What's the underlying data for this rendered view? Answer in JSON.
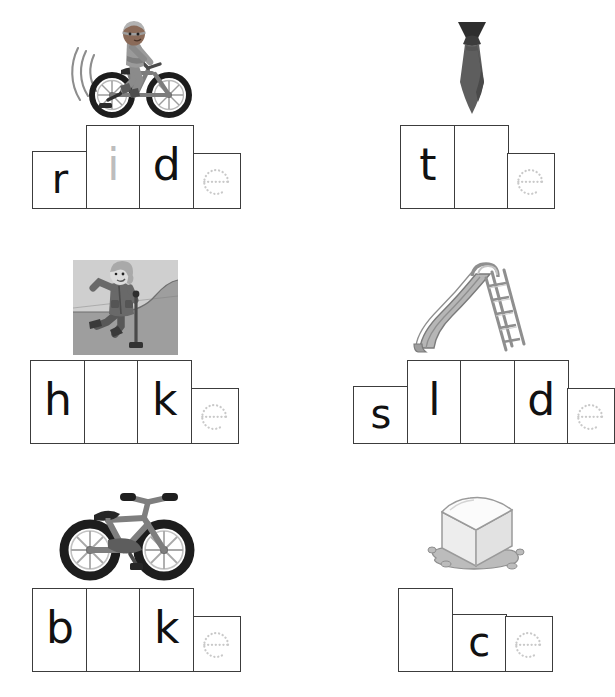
{
  "worksheet": {
    "type": "phonics-worksheet",
    "theme": "long-i magic-e words",
    "background_color": "#ffffff",
    "ink_color": "#3c3c3c",
    "letter_color": "#111111",
    "faint_letter_color": "#bdbdbd",
    "trace_letter_color": "#c9c9c9"
  },
  "items": [
    {
      "id": "item-ride",
      "word": "ride",
      "picture_name": "child-riding-bicycle-picture",
      "picture_alt": "child riding a bicycle with motion lines",
      "cells": [
        {
          "letter": "r",
          "height": "short",
          "style": "bold"
        },
        {
          "letter": "i",
          "height": "tall",
          "style": "faint"
        },
        {
          "letter": "d",
          "height": "tall",
          "style": "bold"
        },
        {
          "letter": "e",
          "height": "trace",
          "style": "dotted"
        }
      ]
    },
    {
      "id": "item-tie",
      "word": "tie",
      "picture_name": "necktie-picture",
      "picture_alt": "dark gray necktie",
      "cells": [
        {
          "letter": "t",
          "height": "tall",
          "style": "bold"
        },
        {
          "letter": "",
          "height": "tall",
          "style": "blank"
        },
        {
          "letter": "e",
          "height": "trace",
          "style": "dotted"
        }
      ]
    },
    {
      "id": "item-hike",
      "word": "hike",
      "picture_name": "hiker-picture",
      "picture_alt": "person hiking with a walking stick on a hill",
      "cells": [
        {
          "letter": "h",
          "height": "tall",
          "style": "bold"
        },
        {
          "letter": "",
          "height": "tall",
          "style": "blank"
        },
        {
          "letter": "k",
          "height": "tall",
          "style": "bold"
        },
        {
          "letter": "e",
          "height": "trace",
          "style": "dotted"
        }
      ]
    },
    {
      "id": "item-slide",
      "word": "slide",
      "picture_name": "playground-slide-picture",
      "picture_alt": "playground slide with ladder",
      "cells": [
        {
          "letter": "s",
          "height": "short",
          "style": "bold"
        },
        {
          "letter": "l",
          "height": "tall",
          "style": "bold"
        },
        {
          "letter": "",
          "height": "tall",
          "style": "blank"
        },
        {
          "letter": "d",
          "height": "tall",
          "style": "bold"
        },
        {
          "letter": "e",
          "height": "trace",
          "style": "dotted"
        }
      ]
    },
    {
      "id": "item-bike",
      "word": "bike",
      "picture_name": "bicycle-picture",
      "picture_alt": "gray bicycle with black tires",
      "cells": [
        {
          "letter": "b",
          "height": "tall",
          "style": "bold"
        },
        {
          "letter": "",
          "height": "tall",
          "style": "blank"
        },
        {
          "letter": "k",
          "height": "tall",
          "style": "bold"
        },
        {
          "letter": "e",
          "height": "trace",
          "style": "dotted"
        }
      ]
    },
    {
      "id": "item-ice",
      "word": "ice",
      "picture_name": "melting-ice-cube-picture",
      "picture_alt": "melting ice cube in a puddle",
      "cells": [
        {
          "letter": "",
          "height": "tall",
          "style": "blank"
        },
        {
          "letter": "c",
          "height": "short",
          "style": "bold"
        },
        {
          "letter": "e",
          "height": "trace",
          "style": "dotted"
        }
      ]
    }
  ]
}
